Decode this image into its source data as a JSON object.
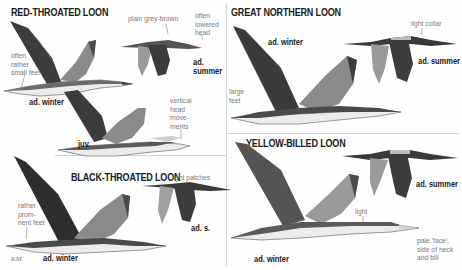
{
  "plate": {
    "colors": {
      "background": "#fefefe",
      "divider": "#d4d4d4",
      "title_text": "#1a1a1a",
      "note_text": "#7a7a7a",
      "bird_dark": "#3c3c3c",
      "bird_mid": "#6e6e6e",
      "bird_light": "#a9a9a9",
      "bird_belly": "#ececec"
    },
    "signature": "KM"
  },
  "species": [
    {
      "name": "RED-THROATED LOON",
      "figures": [
        {
          "label": "ad. winter",
          "notes": [
            "often\nrather\nsmall feet"
          ]
        },
        {
          "label": "ad.\nsummer",
          "notes": [
            "plain grey-brown",
            "often\nlowered\nhead"
          ]
        },
        {
          "label": "juv.",
          "notes": [
            "vertical\nhead\nmove-\nments"
          ]
        }
      ]
    },
    {
      "name": "GREAT NORTHERN LOON",
      "figures": [
        {
          "label": "ad. winter",
          "notes": [
            "large\nfeet"
          ]
        },
        {
          "label": "ad. summer",
          "notes": [
            "light collar"
          ]
        }
      ]
    },
    {
      "name": "BLACK-THROATED LOON",
      "figures": [
        {
          "label": "ad. winter",
          "notes": [
            "rather\nprom-\nnent feet"
          ]
        },
        {
          "label": "ad. s.",
          "notes": [
            "light patches"
          ]
        }
      ]
    },
    {
      "name": "YELLOW-BILLED LOON",
      "figures": [
        {
          "label": "ad. winter",
          "notes": [
            "light",
            "pale 'face',\nside of neck\nand bill"
          ]
        },
        {
          "label": "ad. summer",
          "notes": []
        }
      ]
    }
  ]
}
